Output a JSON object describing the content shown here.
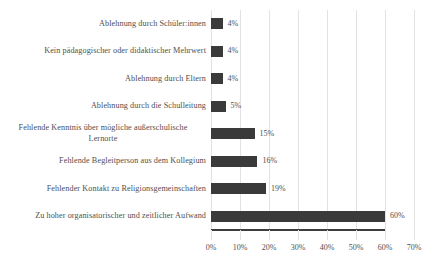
{
  "chart_data": {
    "type": "bar",
    "orientation": "horizontal",
    "title": "",
    "subtitle": "",
    "xlabel": "",
    "ylabel": "",
    "xlim": [
      0,
      70
    ],
    "xticks": [
      0,
      10,
      20,
      30,
      40,
      50,
      60,
      70
    ],
    "xtick_labels": [
      "0%",
      "10%",
      "20%",
      "30%",
      "40%",
      "50%",
      "60%",
      "70%"
    ],
    "grid": "vertical",
    "legend": "none",
    "bar_color": "#3a3a3a",
    "gridline_color": "#e2e2e2",
    "axis_color": "#3d3d3d",
    "text_color": "#4f4f4f",
    "value_label_suffix": "%",
    "categories": [
      "Ablehnung durch Schüler:innen",
      "Kein pädagogischer oder didaktischer Mehrwert",
      "Ablehnung durch Eltern",
      "Ablehnung durch die Schulleitung",
      "Fehlende Kenntnis über mögliche außerschulische Lernorte",
      "Fehlende Begleitperson aus dem Kollegium",
      "Fehlender Kontakt zu Religionsgemeinschaften",
      "Zu hoher organisatorischer und zeitlicher Aufwand"
    ],
    "values": [
      4,
      4,
      4,
      5,
      15,
      16,
      19,
      60
    ],
    "value_labels": [
      "4%",
      "4%",
      "4%",
      "5%",
      "15%",
      "16%",
      "19%",
      "60%"
    ],
    "category_lines": [
      [
        "Ablehnung durch Schüler:innen"
      ],
      [
        "Kein pädagogischer oder didaktischer Mehrwert"
      ],
      [
        "Ablehnung durch Eltern"
      ],
      [
        "Ablehnung durch die Schulleitung"
      ],
      [
        "Fehlende Kenntnis über mögliche außerschulische",
        "Lernorte"
      ],
      [
        "Fehlende Begleitperson aus dem Kollegium"
      ],
      [
        "Fehlender Kontakt zu Religionsgemeinschaften"
      ],
      [
        "Zu hoher organisatorischer und zeitlicher Aufwand"
      ]
    ]
  }
}
